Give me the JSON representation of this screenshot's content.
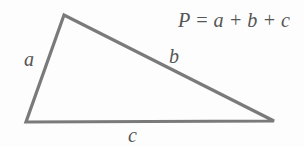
{
  "diagram": {
    "type": "triangle-perimeter",
    "formula": "P = a + b + c",
    "vertices": {
      "top": [
        64,
        15
      ],
      "bottom_left": [
        26,
        122
      ],
      "bottom_right": [
        274,
        121
      ]
    },
    "sides": [
      {
        "name": "a",
        "label": "a",
        "from": "bottom_left",
        "to": "top"
      },
      {
        "name": "b",
        "label": "b",
        "from": "top",
        "to": "bottom_right"
      },
      {
        "name": "c",
        "label": "c",
        "from": "bottom_left",
        "to": "bottom_right"
      }
    ],
    "colors": {
      "stroke": "#7a7a7a",
      "text": "#555555",
      "background": "#fdfdfd"
    }
  }
}
